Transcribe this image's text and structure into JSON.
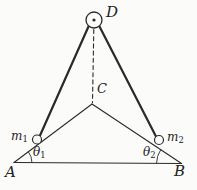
{
  "figure": {
    "background_color": "#fbfbfa",
    "line_color": "#2a2a2a",
    "labels": {
      "D": {
        "text": "D"
      },
      "C": {
        "text": "C"
      },
      "A": {
        "text": "A"
      },
      "B": {
        "text": "B"
      },
      "m1": {
        "base": "m",
        "sub": "1"
      },
      "m2": {
        "base": "m",
        "sub": "2"
      },
      "theta1": {
        "base": "θ",
        "sub": "1"
      },
      "theta2": {
        "base": "θ",
        "sub": "2"
      }
    }
  }
}
